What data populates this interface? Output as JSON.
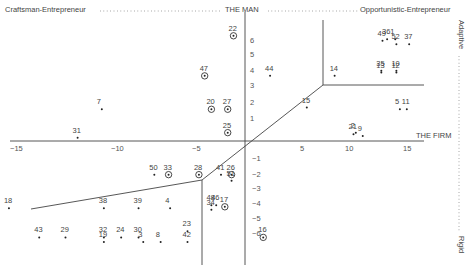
{
  "chart_data": {
    "type": "scatter",
    "title": "",
    "header": {
      "left": "Craftsman-Entrepreneur",
      "center": "THE MAN",
      "right": "Opportunistic-Entrepreneur"
    },
    "side_labels": {
      "top": "Adaptive",
      "bottom": "Rigid"
    },
    "xlabel": "THE FIRM",
    "ylabel": "THE MAN",
    "xlim": [
      -16,
      16
    ],
    "ylim": [
      -7.5,
      7
    ],
    "x_ticks": [
      -15,
      -10,
      -5,
      5,
      10,
      15
    ],
    "y_ticks": [
      6,
      5,
      4,
      3,
      2,
      1,
      -1,
      -2,
      -3,
      -4,
      -5,
      -6
    ],
    "grid": false,
    "legend": {
      "dot": "single case",
      "circled": "circled case"
    },
    "points": [
      {
        "id": "22",
        "x": -1.2,
        "y": 6.3,
        "circled": true
      },
      {
        "id": "47",
        "x": -4.2,
        "y": 3.9,
        "circled": true
      },
      {
        "id": "44",
        "x": 2.2,
        "y": 3.9,
        "circled": false
      },
      {
        "id": "20",
        "x": -3.5,
        "y": 1.9,
        "circled": true
      },
      {
        "id": "27",
        "x": -1.8,
        "y": 1.9,
        "circled": true
      },
      {
        "id": "7",
        "x": -10.8,
        "y": 1.9,
        "circled": false
      },
      {
        "id": "25",
        "x": -1.8,
        "y": 0.5,
        "circled": true
      },
      {
        "id": "31",
        "x": -12.0,
        "y": 0.2,
        "circled": false
      },
      {
        "id": "14",
        "x": 8.4,
        "y": 3.9,
        "circled": false
      },
      {
        "id": "15",
        "x": 5.5,
        "y": 2.0,
        "circled": false
      },
      {
        "id": "36",
        "x": 13.2,
        "y": 6.1,
        "circled": false
      },
      {
        "id": "49",
        "x": 12.8,
        "y": 6.0,
        "circled": false
      },
      {
        "id": "1",
        "x": 13.9,
        "y": 6.1,
        "circled": false
      },
      {
        "id": "52",
        "x": 14.0,
        "y": 5.8,
        "circled": false
      },
      {
        "id": "37",
        "x": 15.1,
        "y": 5.8,
        "circled": false
      },
      {
        "id": "35",
        "x": 12.7,
        "y": 4.2,
        "circled": false
      },
      {
        "id": "10",
        "x": 14.0,
        "y": 4.2,
        "circled": false
      },
      {
        "id": "13",
        "x": 12.7,
        "y": 4.1,
        "circled": false
      },
      {
        "id": "12",
        "x": 14.0,
        "y": 4.1,
        "circled": false
      },
      {
        "id": "5",
        "x": 14.3,
        "y": 1.9,
        "circled": false
      },
      {
        "id": "11",
        "x": 14.9,
        "y": 1.9,
        "circled": false
      },
      {
        "id": "21",
        "x": 10.3,
        "y": 0.4,
        "circled": false
      },
      {
        "id": "2",
        "x": 10.5,
        "y": 0.5,
        "circled": false
      },
      {
        "id": "9",
        "x": 11.1,
        "y": 0.3,
        "circled": false
      },
      {
        "id": "50",
        "x": -7.7,
        "y": -2.2,
        "circled": false
      },
      {
        "id": "33",
        "x": -6.8,
        "y": -2.2,
        "circled": true
      },
      {
        "id": "28",
        "x": -4.8,
        "y": -2.2,
        "circled": true
      },
      {
        "id": "41",
        "x": -2.5,
        "y": -2.2,
        "circled": false
      },
      {
        "id": "26",
        "x": -1.4,
        "y": -2.2,
        "circled": true
      },
      {
        "id": "51",
        "x": -1.4,
        "y": -2.6,
        "circled": false
      },
      {
        "id": "48",
        "x": -3.5,
        "y": -4.2,
        "circled": false
      },
      {
        "id": "46",
        "x": -3.0,
        "y": -4.2,
        "circled": false
      },
      {
        "id": "34",
        "x": -3.5,
        "y": -4.5,
        "circled": false
      },
      {
        "id": "17",
        "x": -2.1,
        "y": -4.3,
        "circled": true
      },
      {
        "id": "16",
        "x": 1.6,
        "y": -6.3,
        "circled": true
      },
      {
        "id": "18",
        "x": -15.4,
        "y": -4.4,
        "circled": false
      },
      {
        "id": "38",
        "x": -10.7,
        "y": -4.4,
        "circled": false
      },
      {
        "id": "39",
        "x": -8.7,
        "y": -4.4,
        "circled": false
      },
      {
        "id": "4",
        "x": -6.7,
        "y": -4.4,
        "circled": false
      },
      {
        "id": "43",
        "x": -13.9,
        "y": -6.3,
        "circled": false
      },
      {
        "id": "29",
        "x": -12.6,
        "y": -6.3,
        "circled": false
      },
      {
        "id": "32",
        "x": -10.7,
        "y": -6.3,
        "circled": false
      },
      {
        "id": "24",
        "x": -9.8,
        "y": -6.3,
        "circled": false
      },
      {
        "id": "30",
        "x": -8.7,
        "y": -6.3,
        "circled": false
      },
      {
        "id": "19",
        "x": -10.7,
        "y": -6.6,
        "circled": false
      },
      {
        "id": "3",
        "x": -8.4,
        "y": -6.6,
        "circled": false
      },
      {
        "id": "8",
        "x": -7.3,
        "y": -6.6,
        "circled": false
      },
      {
        "id": "23",
        "x": -5.6,
        "y": -5.9,
        "circled": false
      },
      {
        "id": "42",
        "x": -5.6,
        "y": -6.6,
        "circled": false
      }
    ]
  }
}
